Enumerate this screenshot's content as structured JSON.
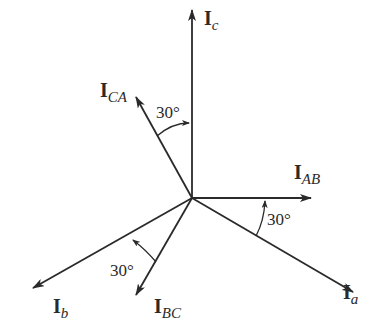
{
  "diagram": {
    "type": "phasor-diagram",
    "origin": [
      192,
      198
    ],
    "colors": {
      "line": "#2a2a2a",
      "background": "#ffffff"
    },
    "phasors": [
      {
        "id": "Ic",
        "main": "I",
        "sub": "c",
        "tip": [
          192,
          10
        ],
        "label_pos": [
          204,
          14
        ]
      },
      {
        "id": "ICA",
        "main": "I",
        "sub": "CA",
        "tip": [
          136,
          97
        ],
        "label_pos": [
          104,
          82
        ]
      },
      {
        "id": "IAB",
        "main": "I",
        "sub": "AB",
        "tip": [
          311,
          198
        ],
        "label_pos": [
          292,
          163
        ]
      },
      {
        "id": "Ia",
        "main": "I",
        "sub": "a",
        "tip": [
          353,
          292
        ],
        "label_pos": [
          344,
          282
        ]
      },
      {
        "id": "Ib",
        "main": "I",
        "sub": "b",
        "tip": [
          33,
          288
        ],
        "label_pos": [
          52,
          295
        ]
      },
      {
        "id": "IBC",
        "main": "I",
        "sub": "BC",
        "tip": [
          136,
          295
        ],
        "label_pos": [
          154,
          295
        ]
      }
    ],
    "angles": [
      {
        "id": "angle-ca-c",
        "label": "30°",
        "label_pos": [
          158,
          105
        ]
      },
      {
        "id": "angle-ab-a",
        "label": "30°",
        "label_pos": [
          268,
          213
        ]
      },
      {
        "id": "angle-bc-b",
        "label": "30°",
        "label_pos": [
          112,
          262
        ]
      }
    ]
  }
}
